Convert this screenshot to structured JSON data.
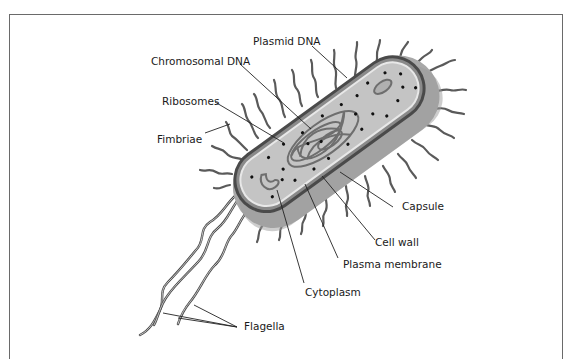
{
  "diagram": {
    "labels": {
      "plasmid_dna": "Plasmid DNA",
      "chromosomal_dna": "Chromosomal DNA",
      "ribosomes": "Ribosomes",
      "fimbriae": "Fimbriae",
      "capsule": "Capsule",
      "cell_wall": "Cell wall",
      "plasma_membrane": "Plasma membrane",
      "cytoplasm": "Cytoplasm",
      "flagella": "Flagella"
    },
    "colors": {
      "capsule": "#a8a8a8",
      "cell_wall": "#4a4a4a",
      "membrane": "#e8e8e8",
      "cytoplasm": "#c4c4c4",
      "dna": "#6e6e6e",
      "frame": "#6a6a6a"
    }
  }
}
